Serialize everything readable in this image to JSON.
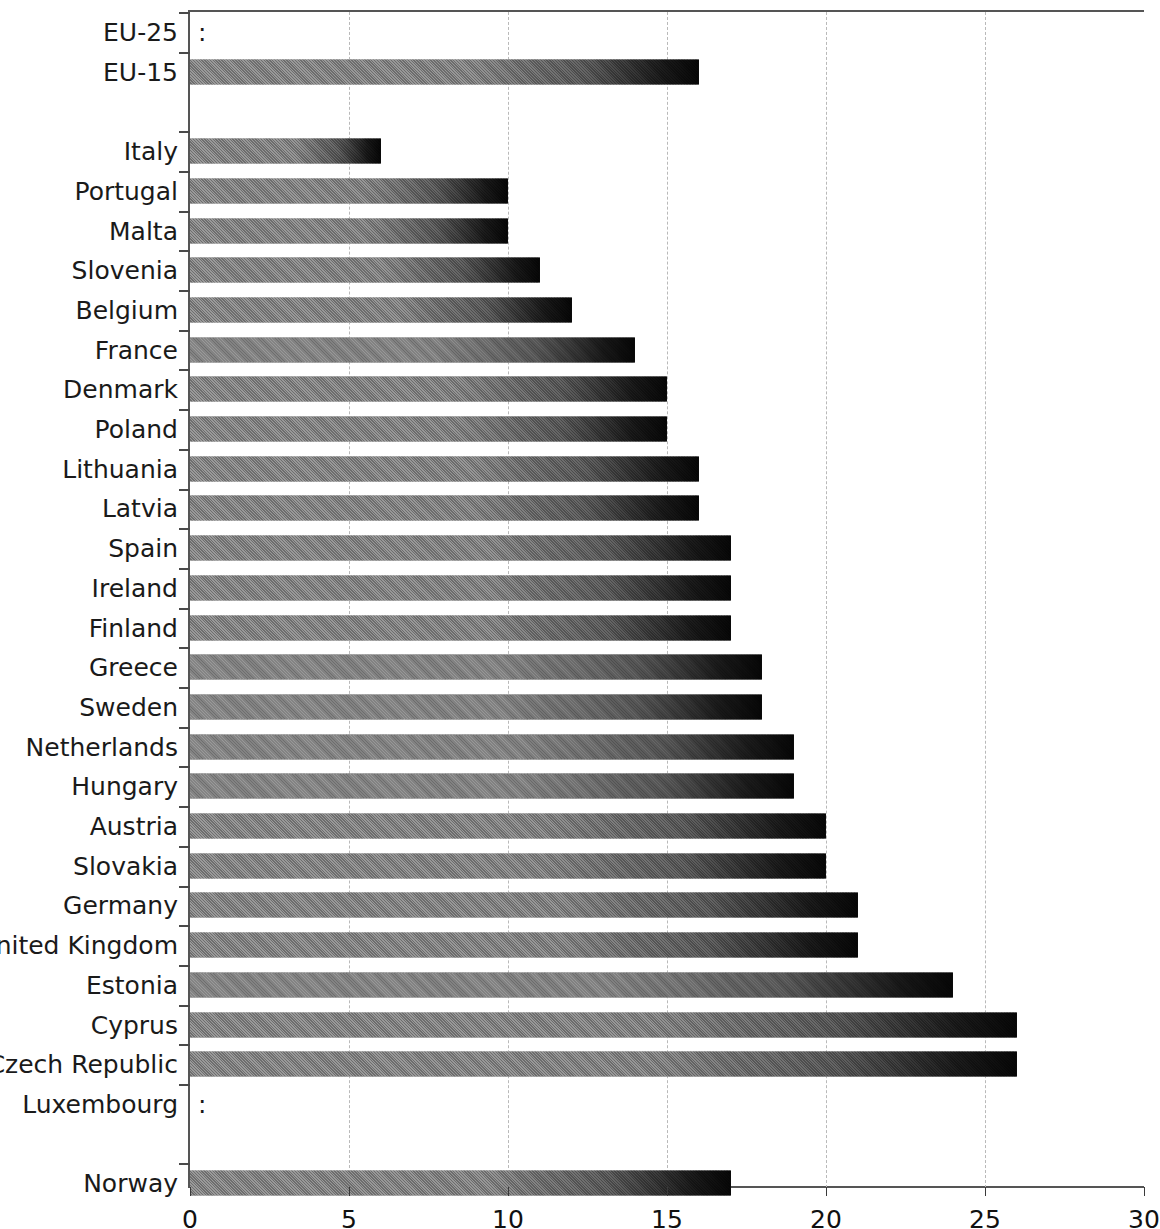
{
  "chart_data": {
    "type": "bar",
    "orientation": "horizontal",
    "title": "",
    "subtitle": "",
    "xlabel": "",
    "ylabel": "",
    "xlim": [
      0,
      30
    ],
    "xticks": [
      "0",
      "5",
      "10",
      "15",
      "20",
      "25",
      "30"
    ],
    "gridlines": [
      "5",
      "10",
      "15",
      "20",
      "25"
    ],
    "grid": true,
    "legend": "none",
    "no_data_symbol": ":",
    "categories": [
      "EU-25",
      "EU-15",
      "",
      "Italy",
      "Portugal",
      "Malta",
      "Slovenia",
      "Belgium",
      "France",
      "Denmark",
      "Poland",
      "Lithuania",
      "Latvia",
      "Spain",
      "Ireland",
      "Finland",
      "Greece",
      "Sweden",
      "Netherlands",
      "Hungary",
      "Austria",
      "Slovakia",
      "Germany",
      "United Kingdom",
      "Estonia",
      "Cyprus",
      "Czech Republic",
      "Luxembourg",
      "",
      "Norway"
    ],
    "values": [
      null,
      16,
      null,
      6,
      10,
      10,
      11,
      12,
      14,
      15,
      15,
      16,
      16,
      17,
      17,
      17,
      18,
      18,
      19,
      19,
      20,
      20,
      21,
      21,
      24,
      26,
      26,
      null,
      null,
      17
    ],
    "rows": [
      {
        "label": "EU-25",
        "value": null,
        "display": ":",
        "spacer": false
      },
      {
        "label": "EU-15",
        "value": 16,
        "display": "16",
        "spacer": false
      },
      {
        "label": "",
        "value": null,
        "display": "",
        "spacer": true
      },
      {
        "label": "Italy",
        "value": 6,
        "display": "6",
        "spacer": false
      },
      {
        "label": "Portugal",
        "value": 10,
        "display": "10",
        "spacer": false
      },
      {
        "label": "Malta",
        "value": 10,
        "display": "10",
        "spacer": false
      },
      {
        "label": "Slovenia",
        "value": 11,
        "display": "11",
        "spacer": false
      },
      {
        "label": "Belgium",
        "value": 12,
        "display": "12",
        "spacer": false
      },
      {
        "label": "France",
        "value": 14,
        "display": "14",
        "spacer": false
      },
      {
        "label": "Denmark",
        "value": 15,
        "display": "15",
        "spacer": false
      },
      {
        "label": "Poland",
        "value": 15,
        "display": "15",
        "spacer": false
      },
      {
        "label": "Lithuania",
        "value": 16,
        "display": "16",
        "spacer": false
      },
      {
        "label": "Latvia",
        "value": 16,
        "display": "16",
        "spacer": false
      },
      {
        "label": "Spain",
        "value": 17,
        "display": "17",
        "spacer": false
      },
      {
        "label": "Ireland",
        "value": 17,
        "display": "17",
        "spacer": false
      },
      {
        "label": "Finland",
        "value": 17,
        "display": "17",
        "spacer": false
      },
      {
        "label": "Greece",
        "value": 18,
        "display": "18",
        "spacer": false
      },
      {
        "label": "Sweden",
        "value": 18,
        "display": "18",
        "spacer": false
      },
      {
        "label": "Netherlands",
        "value": 19,
        "display": "19",
        "spacer": false
      },
      {
        "label": "Hungary",
        "value": 19,
        "display": "19",
        "spacer": false
      },
      {
        "label": "Austria",
        "value": 20,
        "display": "20",
        "spacer": false
      },
      {
        "label": "Slovakia",
        "value": 20,
        "display": "20",
        "spacer": false
      },
      {
        "label": "Germany",
        "value": 21,
        "display": "21",
        "spacer": false
      },
      {
        "label": "United Kingdom",
        "value": 21,
        "display": "21",
        "spacer": false
      },
      {
        "label": "Estonia",
        "value": 24,
        "display": "24",
        "spacer": false
      },
      {
        "label": "Cyprus",
        "value": 26,
        "display": "26",
        "spacer": false
      },
      {
        "label": "Czech Republic",
        "value": 26,
        "display": "26",
        "spacer": false
      },
      {
        "label": "Luxembourg",
        "value": null,
        "display": ":",
        "spacer": false
      },
      {
        "label": "",
        "value": null,
        "display": "",
        "spacer": true
      },
      {
        "label": "Norway",
        "value": 17,
        "display": "17",
        "spacer": false
      }
    ]
  },
  "style": {
    "bar_color_start": "#8b8b8b",
    "bar_color_end": "#0a0a0a",
    "grid_color": "#b9b9b9",
    "axis_color": "#555555",
    "text_color": "#1a1a1a",
    "background": "#ffffff"
  }
}
